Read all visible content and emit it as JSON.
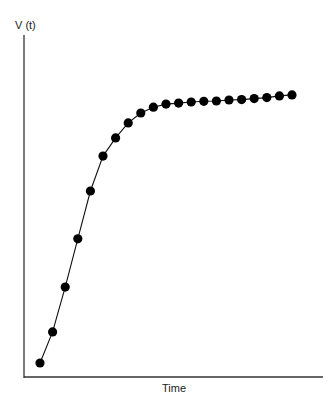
{
  "chart_data": {
    "type": "line",
    "title": "",
    "xlabel": "Time",
    "ylabel": "V (t)",
    "x": [
      1,
      2,
      3,
      4,
      5,
      6,
      7,
      8,
      9,
      10,
      11,
      12,
      13,
      14,
      15,
      16,
      17,
      18,
      19,
      20,
      21
    ],
    "series": [
      {
        "name": "V(t)",
        "marker": "circle",
        "values": [
          4.1,
          13.2,
          26.3,
          40.4,
          54.4,
          64.6,
          69.9,
          74.3,
          77.2,
          78.9,
          79.8,
          80.1,
          80.4,
          80.6,
          80.7,
          81.0,
          81.1,
          81.4,
          81.7,
          82.2,
          82.5
        ]
      }
    ],
    "xlim": [
      0,
      23.5
    ],
    "ylim": [
      0,
      100
    ],
    "grid": false,
    "legend": "none",
    "ticks": "none"
  },
  "colors": {
    "line": "#111111",
    "marker": "#000000",
    "axis": "#333333"
  }
}
